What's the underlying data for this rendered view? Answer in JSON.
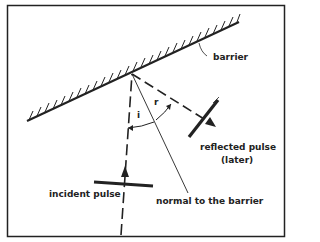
{
  "diagram": {
    "labels": {
      "barrier": "barrier",
      "reflected_pulse": "reflected pulse",
      "reflected_pulse_note": "(later)",
      "incident_pulse": "incident pulse",
      "normal": "normal to the barrier",
      "angle_incidence": "i",
      "angle_reflection": "r"
    },
    "colors": {
      "ink": "#222222",
      "background": "#ffffff"
    }
  }
}
